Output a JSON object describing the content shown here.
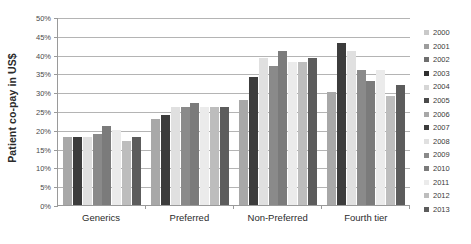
{
  "chart_data": {
    "type": "bar",
    "title": "",
    "xlabel": "",
    "ylabel": "Patient co-pay in US$",
    "ylim": [
      0,
      50
    ],
    "yunit": "%",
    "grid": true,
    "legend_position": "right",
    "ytick_labels": [
      "50%",
      "45%",
      "40%",
      "35%",
      "30%",
      "25%",
      "20%",
      "15%",
      "10%",
      "5%",
      "0%"
    ],
    "ytick_values": [
      50,
      45,
      40,
      35,
      30,
      25,
      20,
      15,
      10,
      5,
      0
    ],
    "categories": [
      "Generics",
      "Preferred",
      "Non-Preferred",
      "Fourth tier"
    ],
    "legend_entries": [
      "2000",
      "2001",
      "2002",
      "2003",
      "2004",
      "2005",
      "2006",
      "2007",
      "2008",
      "2009",
      "2010",
      "2011",
      "2012",
      "2013"
    ],
    "series_colors": [
      "#c9c9c9",
      "#9d9d9d",
      "#6e6e6e",
      "#2f2f2f",
      "#d6d6d6",
      "#4a4a4a",
      "#a8a8a8",
      "#3c3c3c",
      "#e0e0e0",
      "#8a8a8a",
      "#7b7b7b",
      "#ebebeb",
      "#bdbdbd",
      "#5c5c5c"
    ],
    "series": [
      {
        "name": "2006",
        "color": "#a8a8a8",
        "values": [
          18,
          23,
          28,
          30
        ]
      },
      {
        "name": "2007",
        "color": "#3c3c3c",
        "values": [
          18,
          24,
          34,
          43
        ]
      },
      {
        "name": "2008",
        "color": "#e0e0e0",
        "values": [
          18,
          26,
          39,
          41
        ]
      },
      {
        "name": "2009",
        "color": "#8a8a8a",
        "values": [
          19,
          26,
          37,
          36
        ]
      },
      {
        "name": "2010",
        "color": "#7b7b7b",
        "values": [
          21,
          27,
          41,
          33
        ]
      },
      {
        "name": "2011",
        "color": "#ebebeb",
        "values": [
          20,
          26,
          38,
          36
        ]
      },
      {
        "name": "2012",
        "color": "#bdbdbd",
        "values": [
          17,
          26,
          38,
          29
        ]
      },
      {
        "name": "2013",
        "color": "#5c5c5c",
        "values": [
          18,
          26,
          39,
          32
        ]
      }
    ]
  }
}
